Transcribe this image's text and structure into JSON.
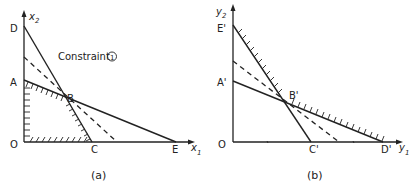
{
  "panel_a": {
    "caption": "(a)",
    "axis_x": "x",
    "axis_x_sub": "1",
    "axis_y": "x",
    "axis_y_sub": "2",
    "origin": "O",
    "points": {
      "D": "D",
      "A": "A",
      "B": "B",
      "C": "C",
      "E": "E"
    },
    "annotation": "Constraint",
    "annotation_marker": "1"
  },
  "panel_b": {
    "caption": "(b)",
    "axis_x": "y",
    "axis_x_sub": "1",
    "axis_y": "y",
    "axis_y_sub": "2",
    "origin": "O",
    "points": {
      "E": "E'",
      "A": "A'",
      "B": "B'",
      "C": "C'",
      "D": "D'"
    }
  }
}
